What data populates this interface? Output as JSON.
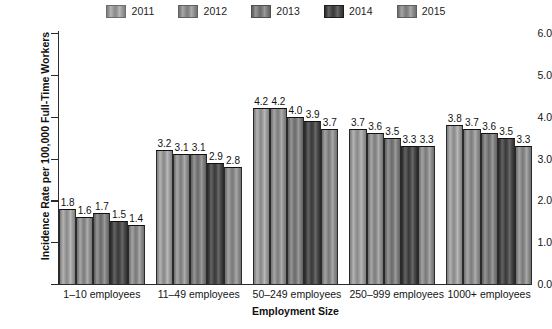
{
  "chart_data": {
    "type": "bar",
    "title": "",
    "xlabel": "Employment Size",
    "ylabel": "Incidence Rate per 100,000 Full-Time Workers",
    "ylim": [
      0.0,
      6.0
    ],
    "ytick_labels": [
      "6.0",
      "5.0",
      "4.0",
      "3.0",
      "2.0",
      "1.0",
      "0.0"
    ],
    "yticks": [
      6.0,
      5.0,
      4.0,
      3.0,
      2.0,
      1.0,
      0.0
    ],
    "grid": false,
    "legend_position": "top-center",
    "categories": [
      "1–10 employees",
      "11–49 employees",
      "50–249 employees",
      "250–999 employees",
      "1000+ employees"
    ],
    "series": [
      {
        "name": "2011",
        "color": "#9a9a9a",
        "values": [
          1.8,
          3.2,
          4.2,
          3.7,
          3.8
        ]
      },
      {
        "name": "2012",
        "color": "#8e8e8e",
        "values": [
          1.6,
          3.1,
          4.2,
          3.6,
          3.7
        ]
      },
      {
        "name": "2013",
        "color": "#7c7c7c",
        "values": [
          1.7,
          3.1,
          4.0,
          3.5,
          3.6
        ]
      },
      {
        "name": "2014",
        "color": "#4a4a4a",
        "values": [
          1.5,
          2.9,
          3.9,
          3.3,
          3.5
        ]
      },
      {
        "name": "2015",
        "color": "#8a8a8a",
        "values": [
          1.4,
          2.8,
          3.7,
          3.3,
          3.3
        ]
      }
    ],
    "value_labels": [
      [
        "1.8",
        "1.6",
        "1.7",
        "1.5",
        "1.4"
      ],
      [
        "3.2",
        "3.1",
        "3.1",
        "2.9",
        "2.8"
      ],
      [
        "4.2",
        "4.2",
        "4.0",
        "3.9",
        "3.7"
      ],
      [
        "3.7",
        "3.6",
        "3.5",
        "3.3",
        "3.3"
      ],
      [
        "3.8",
        "3.7",
        "3.6",
        "3.5",
        "3.3"
      ]
    ]
  }
}
